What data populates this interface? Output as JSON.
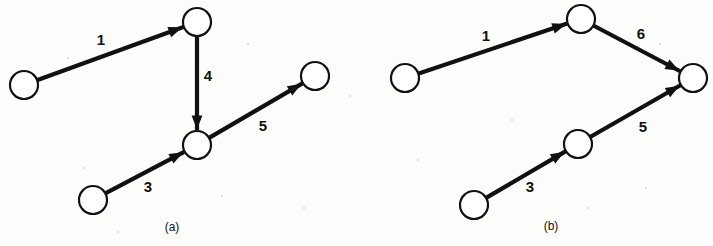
{
  "figure": {
    "type": "directed-graph-pair",
    "background_color": "#fdfdfc",
    "ink_color": "#111111",
    "node_fill": "#ffffff",
    "panels": [
      {
        "id": "a",
        "caption": "(a)",
        "caption_pos": [
          172,
          228
        ],
        "nodes": [
          {
            "id": "a1",
            "cx": 24,
            "cy": 85,
            "r": 14
          },
          {
            "id": "a2",
            "cx": 197,
            "cy": 22,
            "r": 14
          },
          {
            "id": "a3",
            "cx": 197,
            "cy": 145,
            "r": 14
          },
          {
            "id": "a4",
            "cx": 315,
            "cy": 76,
            "r": 14
          },
          {
            "id": "a5",
            "cx": 93,
            "cy": 200,
            "r": 14
          }
        ],
        "edges": [
          {
            "label": "1",
            "from": "a1",
            "to": "a2",
            "label_pos": [
              101,
              41
            ]
          },
          {
            "label": "4",
            "from": "a2",
            "to": "a3",
            "label_pos": [
              208,
              77
            ]
          },
          {
            "label": "5",
            "from": "a3",
            "to": "a4",
            "label_pos": [
              263,
              127
            ]
          },
          {
            "label": "3",
            "from": "a5",
            "to": "a3",
            "label_pos": [
              148,
              188
            ]
          }
        ]
      },
      {
        "id": "b",
        "caption": "(b)",
        "caption_pos": [
          551,
          227
        ],
        "nodes": [
          {
            "id": "b1",
            "cx": 405,
            "cy": 78,
            "r": 14
          },
          {
            "id": "b2",
            "cx": 581,
            "cy": 19,
            "r": 14
          },
          {
            "id": "b3",
            "cx": 693,
            "cy": 78,
            "r": 14
          },
          {
            "id": "b4",
            "cx": 578,
            "cy": 144,
            "r": 14
          },
          {
            "id": "b5",
            "cx": 474,
            "cy": 205,
            "r": 14
          }
        ],
        "edges": [
          {
            "label": "1",
            "from": "b1",
            "to": "b2",
            "label_pos": [
              486,
              37
            ]
          },
          {
            "label": "6",
            "from": "b2",
            "to": "b3",
            "label_pos": [
              641,
              35
            ]
          },
          {
            "label": "5",
            "from": "b4",
            "to": "b3",
            "label_pos": [
              643,
              128
            ]
          },
          {
            "label": "3",
            "from": "b5",
            "to": "b4",
            "label_pos": [
              530,
              188
            ]
          }
        ]
      }
    ]
  }
}
